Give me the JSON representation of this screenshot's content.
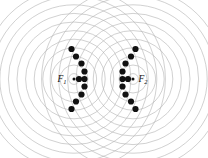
{
  "figure": {
    "width": 208,
    "height": 158,
    "background_color": "#ffffff",
    "wave_color": "#b5b5b5",
    "dot_color": "#111111",
    "label_color": "#111111"
  },
  "sources": [
    {
      "id": "F1",
      "label": "F",
      "subscript": "1",
      "cx": 74,
      "cy": 79,
      "label_x": 66.5,
      "label_y": 82,
      "ring_count": 11,
      "ring_spacing": 8.6,
      "first_ring_radius": 5.4
    },
    {
      "id": "F2",
      "label": "F",
      "subscript": "2",
      "cx": 133,
      "cy": 79,
      "label_x": 138.5,
      "label_y": 82,
      "ring_count": 11,
      "ring_spacing": 8.6,
      "first_ring_radius": 5.4
    }
  ],
  "chart_data": {
    "type": "scatter",
    "xlabel": "",
    "ylabel": "",
    "xlim": [
      0,
      208
    ],
    "ylim": [
      0,
      158
    ],
    "grid": false,
    "legend": "none",
    "annotations": [
      {
        "text": "F1",
        "x": 74,
        "y": 79
      },
      {
        "text": "F2",
        "x": 133,
        "y": 79
      }
    ],
    "series": [
      {
        "name": "intersection-dots-left",
        "marker": "filled-circle",
        "marker_size": 3.1,
        "color": "#111111",
        "points": [
          {
            "x": 71.5,
            "y": 49.0
          },
          {
            "x": 76.0,
            "y": 56.5
          },
          {
            "x": 81.5,
            "y": 63.5
          },
          {
            "x": 84.5,
            "y": 71.5
          },
          {
            "x": 79.0,
            "y": 79.0
          },
          {
            "x": 84.5,
            "y": 79.0
          },
          {
            "x": 84.5,
            "y": 86.5
          },
          {
            "x": 81.5,
            "y": 94.5
          },
          {
            "x": 76.0,
            "y": 101.5
          },
          {
            "x": 71.5,
            "y": 109.0
          }
        ]
      },
      {
        "name": "intersection-dots-right",
        "marker": "filled-circle",
        "marker_size": 3.1,
        "color": "#111111",
        "points": [
          {
            "x": 135.5,
            "y": 49.0
          },
          {
            "x": 131.0,
            "y": 56.5
          },
          {
            "x": 125.5,
            "y": 63.5
          },
          {
            "x": 122.5,
            "y": 71.5
          },
          {
            "x": 122.5,
            "y": 79.0
          },
          {
            "x": 128.0,
            "y": 79.0
          },
          {
            "x": 122.5,
            "y": 86.5
          },
          {
            "x": 125.5,
            "y": 94.5
          },
          {
            "x": 131.0,
            "y": 101.5
          },
          {
            "x": 135.5,
            "y": 109.0
          }
        ]
      }
    ]
  }
}
